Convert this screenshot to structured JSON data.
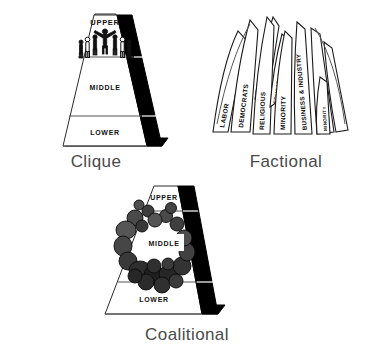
{
  "page": {
    "background_color": "#ffffff"
  },
  "figures": [
    {
      "id": "clique",
      "caption": "Clique",
      "shape": "pyramid",
      "tiers": [
        "UPPER",
        "MIDDLE",
        "LOWER"
      ],
      "right_face_color": "#000000",
      "left_face_color": "#ffffff",
      "occupant_note": "small human figures clustered at apex"
    },
    {
      "id": "factional",
      "caption": "Factional",
      "shape": "fan-of-petals",
      "petals": [
        "LABOR",
        "DEMOCRATS",
        "SPECIAL INTERESTS",
        "RELIGIOUS",
        "EDUCATORS",
        "MINORITY",
        "BUSINESS & INDUSTRY",
        "REPUBLICANS",
        "MINORITY"
      ]
    },
    {
      "id": "coalitional",
      "caption": "Coalitional",
      "shape": "pyramid",
      "tiers": [
        "UPPER",
        "MIDDLE",
        "LOWER"
      ],
      "right_face_color": "#000000",
      "left_face_color": "#ffffff",
      "occupant_note": "ring of dark irregular blobs surrounding the middle tier"
    }
  ],
  "clique": {
    "caption": "Clique",
    "tier_upper": "UPPER",
    "tier_middle": "MIDDLE",
    "tier_lower": "LOWER"
  },
  "factional": {
    "caption": "Factional",
    "petals": [
      {
        "label": "LABOR"
      },
      {
        "label": "DEMOCRATS"
      },
      {
        "label": "SPECIAL INTERESTS"
      },
      {
        "label": "RELIGIOUS"
      },
      {
        "label": "EDUCATORS"
      },
      {
        "label": "MINORITY"
      },
      {
        "label": "BUSINESS & INDUSTRY"
      },
      {
        "label": "REPUBLICANS"
      },
      {
        "label": "MINORITY"
      }
    ]
  },
  "coalitional": {
    "caption": "Coalitional",
    "tier_upper": "UPPER",
    "tier_middle": "MIDDLE",
    "tier_lower": "LOWER"
  }
}
